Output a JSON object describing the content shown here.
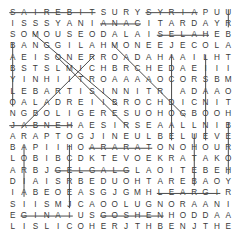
{
  "puzzle": {
    "type": "word-search",
    "rows": 20,
    "cols": 20,
    "grid": [
      [
        "S",
        "A",
        "I",
        "R",
        "E",
        "B",
        "I",
        "T",
        "S",
        "U",
        "R",
        "Y",
        "S",
        "Y",
        "R",
        "I",
        "A",
        "P",
        "U",
        "U"
      ],
      [
        "I",
        "S",
        "S",
        "S",
        "Y",
        "A",
        "N",
        "I",
        "A",
        "N",
        "A",
        "C",
        "I",
        "T",
        "A",
        "R",
        "D",
        "A",
        "Y",
        "R"
      ],
      [
        "S",
        "O",
        "M",
        "O",
        "U",
        "S",
        "E",
        "O",
        "D",
        "A",
        "L",
        "A",
        "I",
        "S",
        "E",
        "L",
        "A",
        "H",
        "E",
        "B"
      ],
      [
        "B",
        "A",
        "N",
        "G",
        "G",
        "I",
        "L",
        "A",
        "H",
        "M",
        "O",
        "N",
        "E",
        "E",
        "J",
        "E",
        "C",
        "O",
        "L",
        "A"
      ],
      [
        "A",
        "E",
        "I",
        "S",
        "O",
        "N",
        "E",
        "R",
        "R",
        "O",
        "A",
        "D",
        "A",
        "H",
        "A",
        "A",
        "I",
        "L",
        "H",
        "T"
      ],
      [
        "B",
        "S",
        "T",
        "S",
        "L",
        "M",
        "I",
        "C",
        "H",
        "B",
        "R",
        "C",
        "H",
        "E",
        "D",
        "A",
        "E",
        "I",
        "I",
        "I"
      ],
      [
        "Y",
        "I",
        "N",
        "H",
        "I",
        "I",
        "T",
        "R",
        "O",
        "A",
        "A",
        "A",
        "A",
        "O",
        "C",
        "O",
        "R",
        "S",
        "B",
        "M"
      ],
      [
        "L",
        "E",
        "B",
        "A",
        "R",
        "T",
        "I",
        "S",
        "I",
        "N",
        "N",
        "I",
        "T",
        "R",
        " ",
        "A",
        "D",
        "A",
        "A",
        "O"
      ],
      [
        "O",
        "A",
        "L",
        "A",
        "D",
        "R",
        "E",
        "I",
        "I",
        "B",
        "R",
        "O",
        "C",
        "H",
        "D",
        "I",
        "C",
        "N",
        "I",
        "T"
      ],
      [
        "N",
        "G",
        "B",
        "O",
        "L",
        "I",
        "G",
        "E",
        "R",
        "E",
        "S",
        "U",
        "O",
        "H",
        "O",
        "G",
        "B",
        "O",
        "O",
        "H"
      ],
      [
        "J",
        "A",
        "B",
        "N",
        "E",
        "H",
        "A",
        "E",
        "S",
        "I",
        "R",
        "S",
        "E",
        "A",
        "A",
        "L",
        "L",
        "N",
        "I",
        "B"
      ],
      [
        "A",
        "R",
        "A",
        "P",
        "T",
        "O",
        "G",
        "J",
        "I",
        "N",
        "E",
        "U",
        "L",
        "B",
        "E",
        "L",
        "U",
        "E",
        "V",
        "E"
      ],
      [
        "B",
        "A",
        "P",
        "I",
        "I",
        "H",
        "O",
        "A",
        "R",
        "A",
        "R",
        "A",
        "T",
        "O",
        "N",
        "O",
        "H",
        "O",
        "U",
        "R"
      ],
      [
        "L",
        "O",
        "B",
        "I",
        "B",
        "C",
        "D",
        "K",
        "T",
        "E",
        "V",
        "O",
        "E",
        "K",
        "R",
        "A",
        "T",
        "A",
        "K",
        "O"
      ],
      [
        "A",
        "R",
        "B",
        "J",
        "G",
        "E",
        "L",
        "G",
        "A",
        "L",
        "G",
        "L",
        "A",
        "O",
        "I",
        "T",
        "E",
        "B",
        "E",
        "H"
      ],
      [
        "D",
        "I",
        "A",
        "I",
        "S",
        "R",
        "B",
        "E",
        "D",
        "U",
        "O",
        "H",
        "T",
        "A",
        "R",
        "E",
        "B",
        "A",
        "O",
        "Y"
      ],
      [
        "I",
        "A",
        "B",
        "E",
        "O",
        "E",
        "A",
        "S",
        "G",
        "J",
        "G",
        "M",
        "H",
        "L",
        "E",
        "A",
        "R",
        "G",
        "I",
        "R"
      ],
      [
        "S",
        "I",
        "I",
        "S",
        "M",
        "J",
        "C",
        "A",
        "O",
        "O",
        "L",
        "U",
        "G",
        "N",
        "O",
        "R",
        "A",
        "A",
        "N",
        "I"
      ],
      [
        "E",
        "G",
        "I",
        "N",
        "A",
        "I",
        "U",
        "S",
        "G",
        "O",
        "S",
        "H",
        "E",
        "N",
        "H",
        "O",
        "D",
        "D",
        "A",
        "A"
      ],
      [
        "L",
        "I",
        "S",
        "L",
        "I",
        "C",
        "O",
        "H",
        "E",
        "R",
        "J",
        "T",
        "H",
        "B",
        "E",
        "N",
        "J",
        "T",
        "H",
        "E"
      ]
    ],
    "found_words": [
      {
        "word": "SAIREBIT",
        "start": [
          0,
          0
        ],
        "end": [
          0,
          7
        ],
        "direction": "horizontal"
      },
      {
        "word": "SYRIA",
        "start": [
          0,
          12
        ],
        "end": [
          0,
          16
        ],
        "direction": "horizontal"
      },
      {
        "word": "ANAC",
        "start": [
          1,
          8
        ],
        "end": [
          1,
          11
        ],
        "direction": "horizontal"
      },
      {
        "word": "SELAH",
        "start": [
          2,
          13
        ],
        "end": [
          2,
          17
        ],
        "direction": "horizontal"
      },
      {
        "word": "JABNEH",
        "start": [
          10,
          0
        ],
        "end": [
          10,
          5
        ],
        "direction": "horizontal"
      },
      {
        "word": "ARARAT",
        "start": [
          12,
          7
        ],
        "end": [
          12,
          12
        ],
        "direction": "horizontal"
      },
      {
        "word": "GILGAL",
        "start": [
          14,
          4
        ],
        "end": [
          14,
          10
        ],
        "direction": "horizontal"
      },
      {
        "word": "LEARSI",
        "start": [
          16,
          13
        ],
        "end": [
          16,
          18
        ],
        "direction": "horizontal"
      },
      {
        "word": "GINA",
        "start": [
          18,
          1
        ],
        "end": [
          18,
          5
        ],
        "direction": "horizontal"
      },
      {
        "word": "GOSHEN",
        "start": [
          18,
          8
        ],
        "end": [
          18,
          13
        ],
        "direction": "horizontal"
      },
      {
        "word": "diagonal-1",
        "start": [
          2,
          2
        ],
        "end": [
          8,
          9
        ],
        "direction": "diagonal"
      },
      {
        "word": "diagonal-2",
        "start": [
          3,
          9
        ],
        "end": [
          9,
          15
        ],
        "direction": "diagonal"
      },
      {
        "word": "diagonal-3",
        "start": [
          4,
          4
        ],
        "end": [
          10,
          10
        ],
        "direction": "diagonal"
      },
      {
        "word": "diagonal-4",
        "start": [
          10,
          1
        ],
        "end": [
          4,
          7
        ],
        "direction": "anti-diagonal"
      },
      {
        "word": "vertical-col0",
        "start": [
          3,
          0
        ],
        "end": [
          8,
          0
        ],
        "direction": "vertical"
      },
      {
        "word": "vertical-col19",
        "start": [
          0,
          19
        ],
        "end": [
          1,
          19
        ],
        "direction": "vertical"
      },
      {
        "word": "vertical-col14",
        "start": [
          4,
          14
        ],
        "end": [
          11,
          14
        ],
        "direction": "vertical"
      },
      {
        "word": "vertical-col17",
        "start": [
          4,
          17
        ],
        "end": [
          11,
          17
        ],
        "direction": "vertical"
      },
      {
        "word": "vertical-col19b",
        "start": [
          10,
          19
        ],
        "end": [
          14,
          19
        ],
        "direction": "vertical"
      },
      {
        "word": "vertical-col16",
        "start": [
          11,
          16
        ],
        "end": [
          15,
          16
        ],
        "direction": "vertical"
      },
      {
        "word": "vertical-col1",
        "start": [
          12,
          1
        ],
        "end": [
          16,
          1
        ],
        "direction": "vertical"
      },
      {
        "word": "vertical-col5",
        "start": [
          12,
          5
        ],
        "end": [
          17,
          5
        ],
        "direction": "vertical"
      }
    ]
  }
}
